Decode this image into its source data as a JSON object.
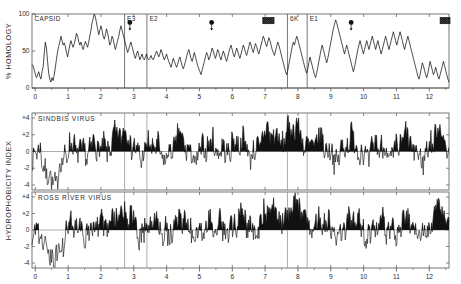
{
  "figure": {
    "background": "#ffffff",
    "ink": "#1a1a1a",
    "frame_color": "#555555"
  },
  "panels": {
    "top": {
      "name": "homology-panel",
      "ylabel": "% HOMOLOGY",
      "yticks": [
        "0",
        "50",
        "100"
      ],
      "ylim": [
        0,
        100
      ],
      "xlim": [
        -0.1,
        12.6
      ],
      "title": "",
      "regions": [
        {
          "label": "CAPSID",
          "start": -0.1,
          "end": 2.72
        },
        {
          "label": "E3",
          "start": 2.72,
          "end": 3.4
        },
        {
          "label": "E2",
          "start": 3.4,
          "end": 7.68
        },
        {
          "label": "6K",
          "start": 7.68,
          "end": 8.28
        },
        {
          "label": "E1",
          "start": 8.28,
          "end": 12.6
        }
      ],
      "glycosylation_markers": [
        2.88,
        5.37,
        9.62
      ],
      "hatched_boxes": [
        {
          "x": 6.93,
          "width": 0.34
        },
        {
          "x": 12.33,
          "width": 0.3
        }
      ]
    },
    "middle": {
      "name": "sindbis-hydrophobicity-panel",
      "title": "SINDBIS VIRUS",
      "yticks": [
        "+4",
        "+2",
        "0",
        "-2",
        "-4"
      ],
      "ylim": [
        -4.6,
        4.6
      ],
      "xlim": [
        -0.1,
        12.6
      ]
    },
    "bottom": {
      "name": "ross-river-hydrophobicity-panel",
      "title": "ROSS RIVER VIRUS",
      "yticks": [
        "+4",
        "+2",
        "0",
        "-2",
        "-4"
      ],
      "ylim": [
        -4.6,
        4.6
      ],
      "xlim": [
        -0.1,
        12.6
      ]
    }
  },
  "shared": {
    "hydrophobicity_ylabel": "HYDROPHOBICITY  INDEX",
    "xticklabels": [
      "0",
      "1",
      "2",
      "3",
      "4",
      "5",
      "6",
      "7",
      "8",
      "9",
      "10",
      "11",
      "12"
    ],
    "xtickvalues": [
      0,
      1,
      2,
      3,
      4,
      5,
      6,
      7,
      8,
      9,
      10,
      11,
      12
    ]
  },
  "chart_data": {
    "type": "line",
    "xlabel": "",
    "ylabel": "% HOMOLOGY / HYDROPHOBICITY INDEX",
    "xlim": [
      -0.1,
      12.6
    ],
    "grid": false,
    "legend": "none",
    "series": [
      {
        "name": "% Homology",
        "panel": "top",
        "ylim": [
          0,
          100
        ],
        "x_step": 0.0455,
        "values": [
          32,
          30,
          24,
          19,
          14,
          17,
          22,
          16,
          12,
          22,
          28,
          46,
          62,
          54,
          36,
          20,
          12,
          8,
          14,
          10,
          18,
          28,
          39,
          49,
          56,
          62,
          70,
          64,
          58,
          61,
          56,
          48,
          42,
          50,
          58,
          64,
          59,
          55,
          60,
          66,
          74,
          70,
          63,
          58,
          62,
          56,
          52,
          58,
          63,
          59,
          55,
          62,
          70,
          78,
          88,
          94,
          100,
          96,
          88,
          80,
          72,
          78,
          84,
          78,
          70,
          66,
          72,
          80,
          74,
          66,
          58,
          62,
          70,
          66,
          58,
          52,
          58,
          64,
          70,
          78,
          84,
          78,
          72,
          66,
          60,
          54,
          48,
          52,
          58,
          62,
          56,
          50,
          44,
          40,
          46,
          50,
          44,
          38,
          42,
          46,
          40,
          38,
          42,
          46,
          40,
          38,
          40,
          44,
          40,
          38,
          42,
          46,
          50,
          46,
          42,
          46,
          52,
          48,
          42,
          38,
          42,
          46,
          40,
          36,
          32,
          28,
          34,
          40,
          36,
          32,
          28,
          32,
          38,
          42,
          36,
          30,
          26,
          30,
          36,
          42,
          48,
          52,
          46,
          40,
          36,
          42,
          48,
          42,
          36,
          30,
          26,
          22,
          18,
          24,
          30,
          36,
          42,
          48,
          44,
          38,
          42,
          48,
          54,
          50,
          44,
          40,
          46,
          52,
          48,
          42,
          38,
          44,
          50,
          46,
          40,
          36,
          42,
          48,
          54,
          58,
          52,
          46,
          42,
          48,
          54,
          50,
          44,
          40,
          46,
          52,
          58,
          54,
          48,
          44,
          50,
          56,
          62,
          58,
          52,
          48,
          54,
          60,
          56,
          50,
          46,
          52,
          58,
          64,
          70,
          66,
          60,
          56,
          62,
          68,
          64,
          58,
          52,
          48,
          44,
          50,
          56,
          62,
          58,
          52,
          46,
          40,
          34,
          28,
          22,
          18,
          24,
          32,
          40,
          48,
          56,
          62,
          58,
          64,
          70,
          66,
          60,
          54,
          48,
          42,
          36,
          30,
          24,
          20,
          26,
          34,
          42,
          36,
          30,
          24,
          18,
          14,
          20,
          28,
          36,
          44,
          52,
          58,
          52,
          46,
          40,
          34,
          40,
          48,
          56,
          64,
          72,
          80,
          86,
          92,
          88,
          82,
          76,
          70,
          64,
          58,
          52,
          46,
          52,
          58,
          52,
          46,
          40,
          34,
          28,
          22,
          28,
          36,
          44,
          52,
          58,
          64,
          58,
          52,
          46,
          52,
          58,
          64,
          58,
          52,
          58,
          64,
          70,
          64,
          58,
          52,
          58,
          64,
          58,
          52,
          46,
          52,
          58,
          64,
          70,
          64,
          58,
          52,
          58,
          64,
          70,
          76,
          70,
          64,
          58,
          64,
          70,
          76,
          70,
          64,
          58,
          52,
          58,
          64,
          70,
          64,
          58,
          52,
          46,
          40,
          34,
          28,
          22,
          16,
          12,
          18,
          26,
          34,
          30,
          24,
          18,
          14,
          20,
          28,
          36,
          30,
          24,
          18,
          22,
          28,
          22,
          16,
          12,
          18,
          24,
          30,
          36,
          30,
          24,
          18,
          12,
          8
        ]
      },
      {
        "name": "Sindbis virus hydrophobicity",
        "panel": "middle",
        "ylim": [
          -4.6,
          4.6
        ],
        "note": "Kyte-Doolittle style profile; positive (hydrophobic) peaks filled black"
      },
      {
        "name": "Ross River virus hydrophobicity",
        "panel": "bottom",
        "ylim": [
          -4.6,
          4.6
        ],
        "note": "Kyte-Doolittle style profile; positive (hydrophobic) peaks filled black"
      }
    ]
  }
}
